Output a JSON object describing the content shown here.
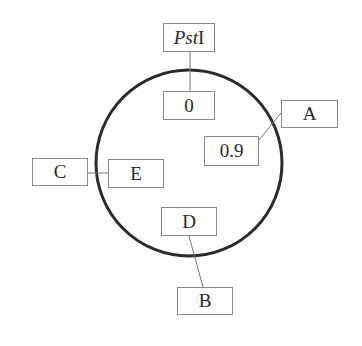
{
  "diagram": {
    "type": "plasmid-map",
    "circle": {
      "cx": 189,
      "cy": 163,
      "r": 93,
      "stroke": "#2b2b2b"
    },
    "labels": [
      {
        "id": "pst1",
        "text_italic": "Pst",
        "text_plain": "I",
        "x": 163,
        "y": 23,
        "w": 52,
        "h": 29
      },
      {
        "id": "zero",
        "text": "0",
        "x": 163,
        "y": 91,
        "w": 52,
        "h": 29
      },
      {
        "id": "a",
        "text": "A",
        "x": 281,
        "y": 100,
        "w": 57,
        "h": 28
      },
      {
        "id": "pos09",
        "text": "0.9",
        "x": 204,
        "y": 136,
        "w": 55,
        "h": 30
      },
      {
        "id": "c",
        "text": "C",
        "x": 32,
        "y": 158,
        "w": 56,
        "h": 28
      },
      {
        "id": "e",
        "text": "E",
        "x": 108,
        "y": 159,
        "w": 56,
        "h": 29
      },
      {
        "id": "d",
        "text": "D",
        "x": 161,
        "y": 207,
        "w": 56,
        "h": 29
      },
      {
        "id": "b",
        "text": "B",
        "x": 177,
        "y": 287,
        "w": 56,
        "h": 28
      }
    ],
    "connectors": [
      {
        "from": "pst1",
        "to": "zero",
        "x1": 190,
        "y1": 52,
        "x2": 190,
        "y2": 91
      },
      {
        "from": "pos09",
        "to": "a",
        "x1": 259,
        "y1": 140,
        "x2": 281,
        "y2": 113
      },
      {
        "from": "c",
        "to": "e",
        "x1": 88,
        "y1": 173,
        "x2": 108,
        "y2": 173
      },
      {
        "from": "d",
        "to": "b",
        "x1": 189,
        "y1": 236,
        "x2": 203,
        "y2": 287
      }
    ]
  }
}
